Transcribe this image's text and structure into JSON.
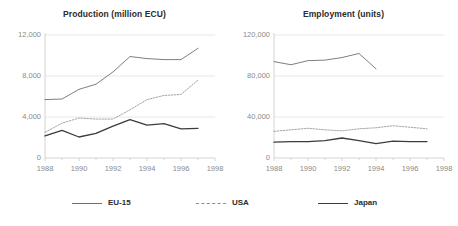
{
  "legend": {
    "position": "bottom",
    "items": [
      {
        "label": "EU-15",
        "style": "solid-thin",
        "color": "#6f6f6f"
      },
      {
        "label": "USA",
        "style": "dashed",
        "color": "#8c8c8c"
      },
      {
        "label": "Japan",
        "style": "solid-thick",
        "color": "#3c3c3c"
      }
    ]
  },
  "chart_data": [
    {
      "type": "line",
      "title": "Production (million ECU)",
      "xlabel": "",
      "ylabel": "",
      "grid": true,
      "xlim": [
        1988,
        1998
      ],
      "ylim": [
        0,
        12000
      ],
      "xticks": [
        1988,
        1990,
        1992,
        1994,
        1996,
        1998
      ],
      "xtick_labels": [
        "1988",
        "1990",
        "1992",
        "1994",
        "1996",
        "1998"
      ],
      "yticks": [
        0,
        4000,
        8000,
        12000
      ],
      "ytick_labels": [
        "0",
        "4,000",
        "8,000",
        "12,000"
      ],
      "x": [
        1988,
        1989,
        1990,
        1991,
        1992,
        1993,
        1994,
        1995,
        1996,
        1997
      ],
      "series": [
        {
          "name": "EU-15",
          "values": [
            5700,
            5750,
            6700,
            7200,
            8400,
            9900,
            9700,
            9600,
            9600,
            10700
          ]
        },
        {
          "name": "USA",
          "values": [
            2500,
            3400,
            3900,
            3800,
            3800,
            4700,
            5700,
            6100,
            6200,
            7600
          ]
        },
        {
          "name": "Japan",
          "values": [
            2150,
            2700,
            2050,
            2400,
            3100,
            3750,
            3200,
            3350,
            2850,
            2900
          ]
        }
      ]
    },
    {
      "type": "line",
      "title": "Employment (units)",
      "xlabel": "",
      "ylabel": "",
      "grid": true,
      "xlim": [
        1988,
        1998
      ],
      "ylim": [
        0,
        120000
      ],
      "xticks": [
        1988,
        1990,
        1992,
        1994,
        1996,
        1998
      ],
      "xtick_labels": [
        "1988",
        "1990",
        "1992",
        "1994",
        "1996",
        "1998"
      ],
      "yticks": [
        0,
        40000,
        80000,
        120000
      ],
      "ytick_labels": [
        "0",
        "40,000",
        "80,000",
        "120,000"
      ],
      "x": [
        1988,
        1989,
        1990,
        1991,
        1992,
        1993,
        1994,
        1995,
        1996,
        1997
      ],
      "series": [
        {
          "name": "EU-15",
          "values": [
            94000,
            91000,
            95000,
            95500,
            98000,
            102000,
            87000,
            null,
            null,
            null
          ]
        },
        {
          "name": "USA",
          "values": [
            26000,
            27500,
            29000,
            27500,
            26500,
            28500,
            29500,
            31500,
            30000,
            28500
          ]
        },
        {
          "name": "Japan",
          "values": [
            15500,
            16000,
            16000,
            17000,
            19500,
            17000,
            14000,
            16500,
            16000,
            16000
          ]
        }
      ]
    }
  ]
}
